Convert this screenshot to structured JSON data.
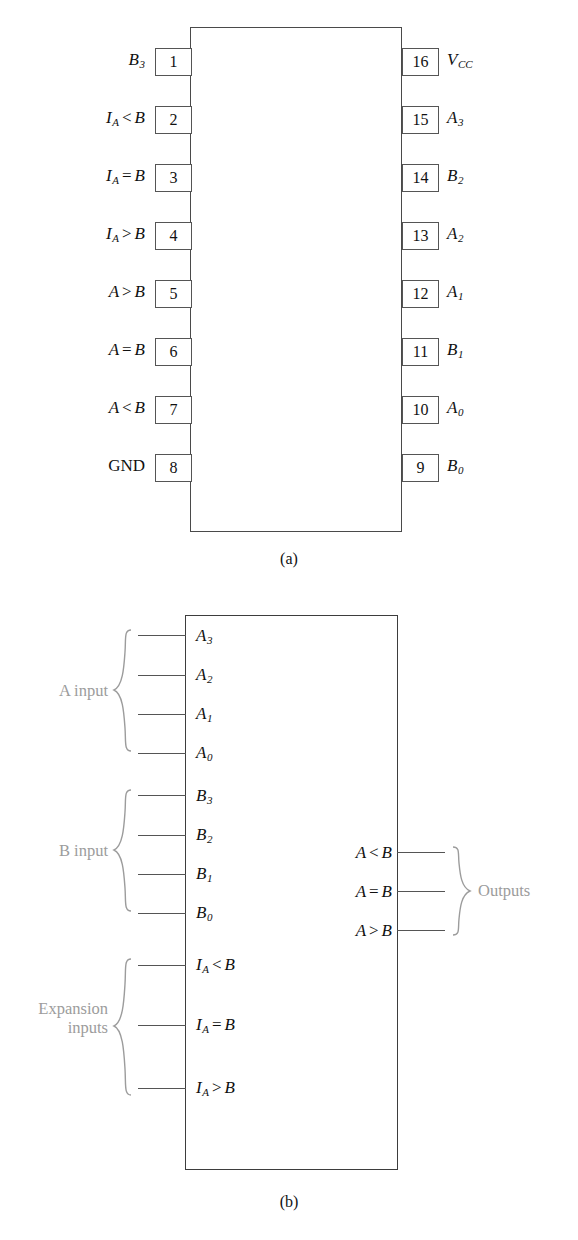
{
  "figure": {
    "captions": {
      "a": "(a)",
      "b": "(b)"
    },
    "colors": {
      "outline": "#4a4a4a",
      "text": "#111111",
      "group_label": "#9c9c9c",
      "background": "#ffffff"
    }
  },
  "part_a": {
    "name": "pin-diagram",
    "package": "16-pin DIP",
    "left_pins": [
      {
        "number": "1",
        "label_base": "B",
        "label_sub": "3",
        "label_text": "B3"
      },
      {
        "number": "2",
        "label_base": "I",
        "label_sub": "A",
        "operator": "<",
        "operand": "B",
        "label_text": "IA < B"
      },
      {
        "number": "3",
        "label_base": "I",
        "label_sub": "A",
        "operator": "=",
        "operand": "B",
        "label_text": "IA = B"
      },
      {
        "number": "4",
        "label_base": "I",
        "label_sub": "A",
        "operator": ">",
        "operand": "B",
        "label_text": "IA > B"
      },
      {
        "number": "5",
        "label_base": "A",
        "label_sub": "",
        "operator": ">",
        "operand": "B",
        "label_text": "A > B"
      },
      {
        "number": "6",
        "label_base": "A",
        "label_sub": "",
        "operator": "=",
        "operand": "B",
        "label_text": "A = B"
      },
      {
        "number": "7",
        "label_base": "A",
        "label_sub": "",
        "operator": "<",
        "operand": "B",
        "label_text": "A < B"
      },
      {
        "number": "8",
        "label_base": "GND",
        "label_sub": "",
        "label_text": "GND"
      }
    ],
    "right_pins": [
      {
        "number": "16",
        "label_base": "V",
        "label_sub": "CC",
        "label_text": "VCC"
      },
      {
        "number": "15",
        "label_base": "A",
        "label_sub": "3",
        "label_text": "A3"
      },
      {
        "number": "14",
        "label_base": "B",
        "label_sub": "2",
        "label_text": "B2"
      },
      {
        "number": "13",
        "label_base": "A",
        "label_sub": "2",
        "label_text": "A2"
      },
      {
        "number": "12",
        "label_base": "A",
        "label_sub": "1",
        "label_text": "A1"
      },
      {
        "number": "11",
        "label_base": "B",
        "label_sub": "1",
        "label_text": "B1"
      },
      {
        "number": "10",
        "label_base": "A",
        "label_sub": "0",
        "label_text": "A0"
      },
      {
        "number": "9",
        "label_base": "B",
        "label_sub": "0",
        "label_text": "B0"
      }
    ]
  },
  "part_b": {
    "name": "logic-block-symbol",
    "groups": {
      "a_input": "A input",
      "b_input": "B input",
      "expansion_inputs": "Expansion\ninputs",
      "outputs": "Outputs"
    },
    "a_inputs": [
      {
        "label_base": "A",
        "label_sub": "3",
        "label_text": "A3"
      },
      {
        "label_base": "A",
        "label_sub": "2",
        "label_text": "A2"
      },
      {
        "label_base": "A",
        "label_sub": "1",
        "label_text": "A1"
      },
      {
        "label_base": "A",
        "label_sub": "0",
        "label_text": "A0"
      }
    ],
    "b_inputs": [
      {
        "label_base": "B",
        "label_sub": "3",
        "label_text": "B3"
      },
      {
        "label_base": "B",
        "label_sub": "2",
        "label_text": "B2"
      },
      {
        "label_base": "B",
        "label_sub": "1",
        "label_text": "B1"
      },
      {
        "label_base": "B",
        "label_sub": "0",
        "label_text": "B0"
      }
    ],
    "expansion_inputs": [
      {
        "label_base": "I",
        "label_sub": "A",
        "operator": "<",
        "operand": "B",
        "label_text": "IA < B"
      },
      {
        "label_base": "I",
        "label_sub": "A",
        "operator": "=",
        "operand": "B",
        "label_text": "IA = B"
      },
      {
        "label_base": "I",
        "label_sub": "A",
        "operator": ">",
        "operand": "B",
        "label_text": "IA > B"
      }
    ],
    "outputs": [
      {
        "label_base": "A",
        "operator": "<",
        "operand": "B",
        "label_text": "A < B"
      },
      {
        "label_base": "A",
        "operator": "=",
        "operand": "B",
        "label_text": "A = B"
      },
      {
        "label_base": "A",
        "operator": ">",
        "operand": "B",
        "label_text": "A > B"
      }
    ]
  }
}
